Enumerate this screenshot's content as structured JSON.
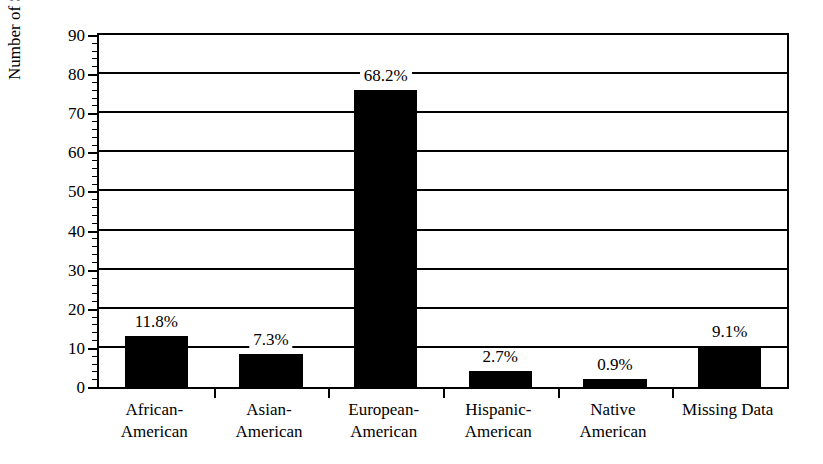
{
  "chart_data": {
    "type": "bar",
    "title": "",
    "xlabel": "",
    "ylabel": "Number of Subjects",
    "ylim": [
      0,
      90
    ],
    "ytick_step": 10,
    "yminor_step": 2,
    "grid": true,
    "legend": null,
    "categories": [
      "African-American",
      "Asian-American",
      "European-American",
      "Hispanic-American",
      "Native American",
      "Missing Data"
    ],
    "category_lines": [
      [
        "African-",
        "American"
      ],
      [
        "Asian-",
        "American"
      ],
      [
        "European-",
        "American"
      ],
      [
        "Hispanic-",
        "American"
      ],
      [
        "Native",
        "American"
      ],
      [
        "Missing Data",
        ""
      ]
    ],
    "values": [
      13,
      8.5,
      76,
      4,
      2,
      10.5
    ],
    "data_labels": [
      "11.8%",
      "7.3%",
      "68.2%",
      "2.7%",
      "0.9%",
      "9.1%"
    ],
    "ytick_labels": [
      "0",
      "10",
      "20",
      "30",
      "40",
      "50",
      "60",
      "70",
      "80",
      "90"
    ],
    "ytick_values": [
      0,
      10,
      20,
      30,
      40,
      50,
      60,
      70,
      80,
      90
    ],
    "bar_color": "#000000",
    "axis_color": "#000000",
    "background_color": "#ffffff"
  }
}
